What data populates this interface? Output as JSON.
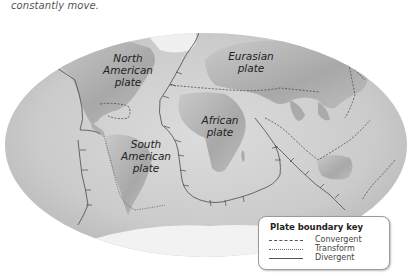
{
  "caption": {
    "line_partial": "plates are moving slowly and",
    "line": "constantly move."
  },
  "plates": [
    {
      "name": "north_american",
      "label_line1": "North",
      "label_line2": "American",
      "label_line3": "plate"
    },
    {
      "name": "eurasian",
      "label_line1": "Eurasian",
      "label_line2": "plate"
    },
    {
      "name": "african",
      "label_line1": "African",
      "label_line2": "plate"
    },
    {
      "name": "south_american",
      "label_line1": "South",
      "label_line2": "American",
      "label_line3": "plate"
    }
  ],
  "key": {
    "title": "Plate boundary key",
    "items": [
      {
        "type": "convergent",
        "label": "Convergent",
        "line_style": "dashed"
      },
      {
        "type": "transform",
        "label": "Transform",
        "line_style": "dotted"
      },
      {
        "type": "divergent",
        "label": "Divergent",
        "line_style": "solid"
      }
    ]
  },
  "colors": {
    "ocean": "#cfcfcf",
    "land": "#b5b5b5",
    "ice": "#f2f2f2",
    "boundary": "#4a4a4a"
  }
}
